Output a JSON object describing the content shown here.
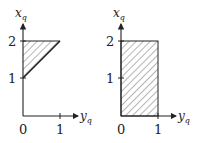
{
  "diagrams": [
    {
      "id": "left",
      "x_axis_label": "y",
      "x_axis_sub": "q",
      "y_axis_label": "x",
      "y_axis_sub": "q",
      "x_ticks": [
        "0",
        "1"
      ],
      "y_ticks": [
        "1",
        "2"
      ],
      "region": "triangle with vertices (0,1), (0,2), (1,2), hatched"
    },
    {
      "id": "right",
      "x_axis_label": "y",
      "x_axis_sub": "q",
      "y_axis_label": "x",
      "y_axis_sub": "q",
      "x_ticks": [
        "0",
        "1"
      ],
      "y_ticks": [
        "1",
        "2"
      ],
      "region": "rectangle [0,1] x [0,2], hatched"
    }
  ]
}
